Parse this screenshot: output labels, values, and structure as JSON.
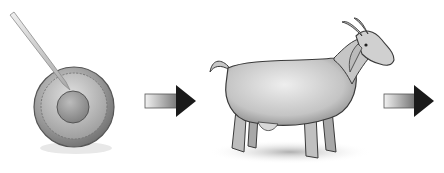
{
  "figure": {
    "steps": [
      {
        "id": "cell",
        "label": "Egg cell being injected with a micropipette"
      },
      {
        "id": "arrow-1",
        "label": "arrow"
      },
      {
        "id": "goat",
        "label": "Goat"
      },
      {
        "id": "arrow-2",
        "label": "arrow"
      }
    ]
  },
  "colors": {
    "background": "#ffffff",
    "cell_outer": "#8a8a8a",
    "cell_inner": "#a9a9a9",
    "nucleus": "#9a9a9a",
    "goat_body": "#cfcfcf",
    "goat_outline": "#3a3a3a",
    "arrow_head": "#1a1a1a",
    "shadow": "#bdbdbd"
  }
}
